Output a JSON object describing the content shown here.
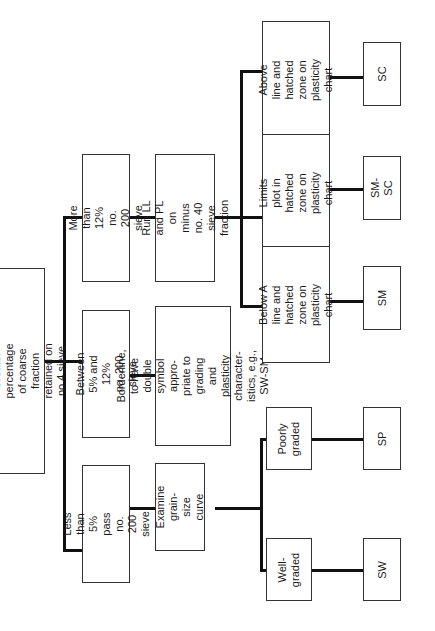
{
  "diagram": {
    "orientation": "rotated -90deg (text reads bottom-to-top)",
    "root": {
      "text": "Sand (S)\nGreater percentage of coarse fraction\nretained on no.4 sieve"
    },
    "level1": [
      {
        "id": "more12",
        "text": "More than 12%\nno. 200 sieve"
      },
      {
        "id": "between",
        "text": "Between 5% and 12%\nno. 200 sieve"
      },
      {
        "id": "less5",
        "text": "Less than 5% pass\nno. 200 sieve"
      }
    ],
    "level2": [
      {
        "id": "runll",
        "text": "Run LL and PL on\nminus no. 40 sieve\nfraction"
      },
      {
        "id": "borderline",
        "text": "Borderline, to have\ndouble symbol appro-\npriate to grading and\nplasticity character-\nistics, e.g., SW-SM"
      },
      {
        "id": "examine",
        "text": "Examine grain-\nsize curve"
      }
    ],
    "level3": [
      {
        "id": "above",
        "text": "Above  line and\nhatched zone on\nplasticity chart"
      },
      {
        "id": "limits",
        "text": "Limits plot in\nhatched zone on\nplasticity chart"
      },
      {
        "id": "below",
        "text": "Below A line and\nhatched zone on\nplasticity chart"
      },
      {
        "id": "poorly",
        "text": "Poorly\ngraded"
      },
      {
        "id": "well",
        "text": "Well-\ngraded"
      }
    ],
    "symbols": [
      {
        "id": "sc",
        "text": "SC"
      },
      {
        "id": "smsc",
        "text": "SM-SC"
      },
      {
        "id": "sm",
        "text": "SM"
      },
      {
        "id": "sp",
        "text": "SP"
      },
      {
        "id": "sw",
        "text": "SW"
      }
    ]
  }
}
